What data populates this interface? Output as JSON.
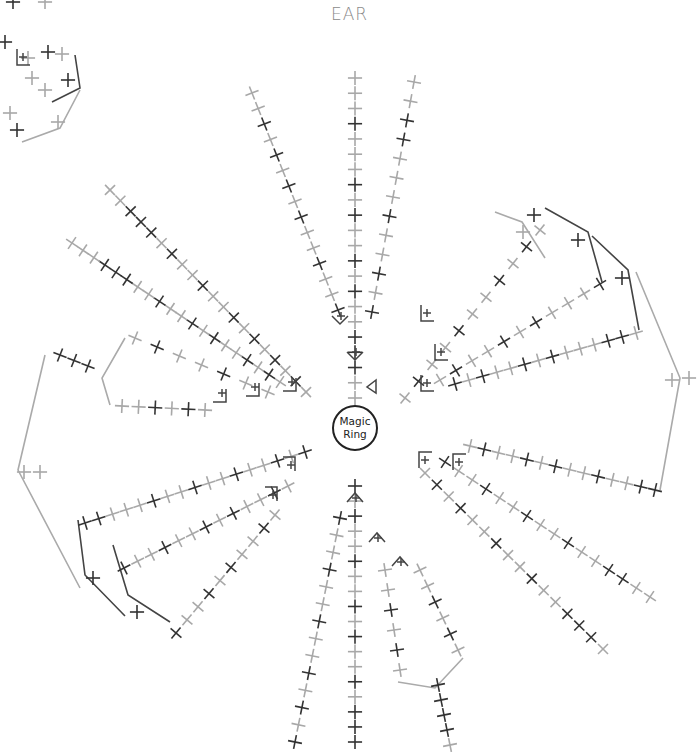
{
  "title": "EAR",
  "center": {
    "label_line1": "Magic",
    "label_line2": "Ring",
    "x": 355,
    "y": 428,
    "r": 22
  },
  "colors": {
    "dark": "#333333",
    "mid": "#666666",
    "light": "#a8a8a8",
    "line_dark": "#444444",
    "line_light": "#aaaaaa"
  },
  "stitch_symbols": {
    "sc": "×",
    "inc": "∨",
    "dec": "∧",
    "slst": "◁"
  },
  "rays": [
    {
      "x1": 355,
      "y1": 398,
      "x2": 355,
      "y2": 78,
      "n": 22,
      "pattern": "LLDDDLLDLDLLDLDLLLDLLL"
    },
    {
      "x1": 338,
      "y1": 310,
      "x2": 252,
      "y2": 93,
      "n": 15,
      "pattern": "DLLDLLDLDLDLDLL"
    },
    {
      "x1": 372,
      "y1": 312,
      "x2": 414,
      "y2": 82,
      "n": 13,
      "pattern": "DLDLLDLLLDDLL"
    },
    {
      "x1": 306,
      "y1": 392,
      "x2": 110,
      "y2": 190,
      "n": 20,
      "pattern": "LDLDLDLDLLDLLDLDDDLL"
    },
    {
      "x1": 280,
      "y1": 382,
      "x2": 72,
      "y2": 243,
      "n": 20,
      "pattern": "LDLDLLDLDLLDLLDDDLL"
    },
    {
      "x1": 268,
      "y1": 392,
      "x2": 135,
      "y2": 338,
      "n": 7,
      "pattern": "LLDLLDL"
    },
    {
      "x1": 205,
      "y1": 410,
      "x2": 122,
      "y2": 406,
      "n": 6,
      "pattern": "LDLDLL"
    },
    {
      "x1": 88,
      "y1": 366,
      "x2": 60,
      "y2": 355,
      "n": 3,
      "pattern": "DDD"
    },
    {
      "x1": 305,
      "y1": 452,
      "x2": 85,
      "y2": 523,
      "n": 17,
      "pattern": "DLDLLDLLDLLDLLLDD"
    },
    {
      "x1": 288,
      "y1": 486,
      "x2": 124,
      "y2": 568,
      "n": 13,
      "pattern": "LDLLDLDLLDLLD"
    },
    {
      "x1": 275,
      "y1": 515,
      "x2": 176,
      "y2": 633,
      "n": 10,
      "pattern": "LDLLDLDLLD"
    },
    {
      "x1": 405,
      "y1": 398,
      "x2": 540,
      "y2": 230,
      "n": 11,
      "pattern": "LDLLDLLDLDL"
    },
    {
      "x1": 440,
      "y1": 380,
      "x2": 600,
      "y2": 284,
      "n": 11,
      "pattern": "LDLLDLDLLLD"
    },
    {
      "x1": 455,
      "y1": 384,
      "x2": 636,
      "y2": 333,
      "n": 14,
      "pattern": "DLDLLDLDLLLDDL"
    },
    {
      "x1": 470,
      "y1": 446,
      "x2": 655,
      "y2": 490,
      "n": 14,
      "pattern": "LDLLDLDLLDLLDD"
    },
    {
      "x1": 445,
      "y1": 462,
      "x2": 650,
      "y2": 597,
      "n": 16,
      "pattern": "DLLDLLDLLDLLDDLL"
    },
    {
      "x1": 425,
      "y1": 473,
      "x2": 603,
      "y2": 649,
      "n": 16,
      "pattern": "LDLDLLDLLDLLDDDL"
    },
    {
      "x1": 355,
      "y1": 486,
      "x2": 355,
      "y2": 742,
      "n": 18,
      "pattern": "DLDLLDLLDLDLLDLDDD"
    },
    {
      "x1": 340,
      "y1": 518,
      "x2": 295,
      "y2": 742,
      "n": 14,
      "pattern": "DLLDLLDLLDLDLD"
    },
    {
      "x1": 385,
      "y1": 570,
      "x2": 400,
      "y2": 670,
      "n": 6,
      "pattern": "LLDLDL"
    },
    {
      "x1": 420,
      "y1": 570,
      "x2": 458,
      "y2": 650,
      "n": 6,
      "pattern": "LLDLDL"
    },
    {
      "x1": 438,
      "y1": 685,
      "x2": 450,
      "y2": 745,
      "n": 5,
      "pattern": "DDDDL"
    }
  ],
  "lines": [
    {
      "points": "45,355 18,470 80,588",
      "tone": "light"
    },
    {
      "points": "125,338 102,378 110,405",
      "tone": "light"
    },
    {
      "points": "78,520 85,575 125,616",
      "tone": "dark"
    },
    {
      "points": "113,545 128,595 170,622",
      "tone": "dark"
    },
    {
      "points": "495,212 522,222 545,258",
      "tone": "light"
    },
    {
      "points": "545,208 588,232 602,282",
      "tone": "dark"
    },
    {
      "points": "592,236 628,270 639,330",
      "tone": "dark"
    },
    {
      "points": "636,272 680,378 660,490",
      "tone": "light"
    },
    {
      "points": "398,682 435,688 463,658",
      "tone": "light"
    },
    {
      "points": "75,55 80,88 52,102",
      "tone": "dark"
    },
    {
      "points": "80,90 60,128 22,142",
      "tone": "light"
    }
  ],
  "extra_stitches": [
    {
      "x": 672,
      "y": 380,
      "t": "L"
    },
    {
      "x": 689,
      "y": 378,
      "t": "L"
    },
    {
      "x": 24,
      "y": 472,
      "t": "L"
    },
    {
      "x": 40,
      "y": 472,
      "t": "L"
    },
    {
      "x": 13,
      "y": 2,
      "t": "D"
    },
    {
      "x": 45,
      "y": 2,
      "t": "L"
    },
    {
      "x": 5,
      "y": 42,
      "t": "D"
    },
    {
      "x": 28,
      "y": 58,
      "t": "L"
    },
    {
      "x": 48,
      "y": 52,
      "t": "D"
    },
    {
      "x": 62,
      "y": 54,
      "t": "L"
    },
    {
      "x": 32,
      "y": 78,
      "t": "L"
    },
    {
      "x": 45,
      "y": 90,
      "t": "L"
    },
    {
      "x": 68,
      "y": 80,
      "t": "D"
    },
    {
      "x": 10,
      "y": 113,
      "t": "L"
    },
    {
      "x": 17,
      "y": 130,
      "t": "D"
    },
    {
      "x": 58,
      "y": 122,
      "t": "L"
    },
    {
      "x": 534,
      "y": 215,
      "t": "D"
    },
    {
      "x": 523,
      "y": 232,
      "t": "L"
    },
    {
      "x": 578,
      "y": 240,
      "t": "D"
    },
    {
      "x": 622,
      "y": 278,
      "t": "D"
    },
    {
      "x": 93,
      "y": 578,
      "t": "D"
    },
    {
      "x": 137,
      "y": 612,
      "t": "D"
    }
  ],
  "brackets": [
    {
      "x": 340,
      "y": 316,
      "kind": "inc"
    },
    {
      "x": 355,
      "y": 352,
      "kind": "inc"
    },
    {
      "x": 355,
      "y": 498,
      "kind": "dec"
    },
    {
      "x": 377,
      "y": 538,
      "kind": "dec"
    },
    {
      "x": 400,
      "y": 562,
      "kind": "dec"
    },
    {
      "x": 221,
      "y": 393,
      "kind": "corner"
    },
    {
      "x": 254,
      "y": 387,
      "kind": "corner"
    },
    {
      "x": 291,
      "y": 382,
      "kind": "corner"
    },
    {
      "x": 290,
      "y": 465,
      "kind": "corner2"
    },
    {
      "x": 272,
      "y": 495,
      "kind": "corner2"
    },
    {
      "x": 426,
      "y": 313,
      "kind": "corner3"
    },
    {
      "x": 440,
      "y": 352,
      "kind": "corner3"
    },
    {
      "x": 426,
      "y": 383,
      "kind": "corner3"
    },
    {
      "x": 424,
      "y": 460,
      "kind": "corner4"
    },
    {
      "x": 458,
      "y": 462,
      "kind": "corner4"
    },
    {
      "x": 22,
      "y": 57,
      "kind": "corner3"
    }
  ],
  "slip_marker": {
    "x": 372,
    "y": 387
  }
}
